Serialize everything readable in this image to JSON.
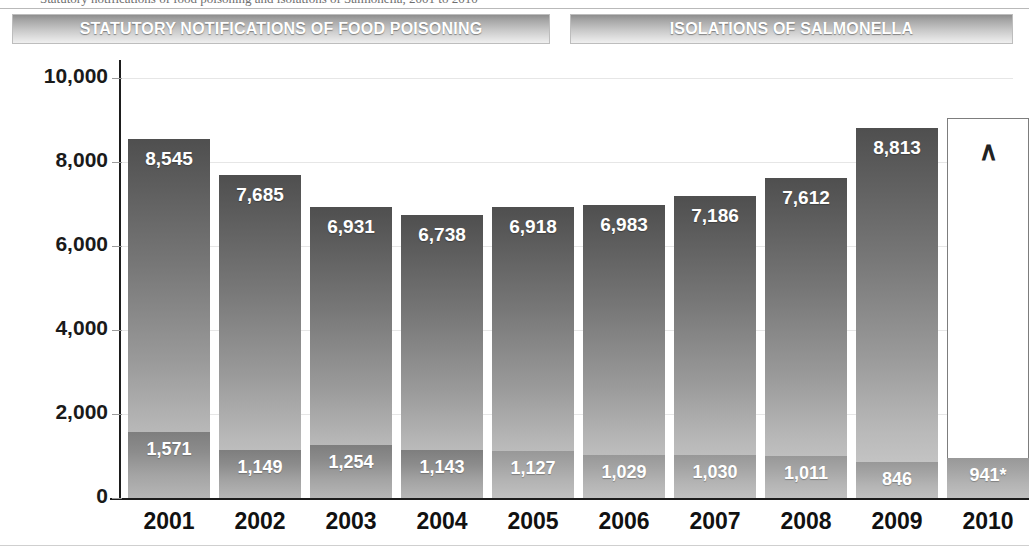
{
  "top_sliver": {
    "clipped_text": "Statutory notifications of food poisoning and isolations of Salmonella, 2001 to 2010"
  },
  "legend": {
    "left_label": "STATUTORY NOTIFICATIONS OF FOOD POISONING",
    "right_label": "ISOLATIONS OF SALMONELLA"
  },
  "chart_data": {
    "type": "bar",
    "title": "",
    "xlabel": "",
    "ylabel": "",
    "ylim": [
      0,
      10000
    ],
    "ytick_values": [
      0,
      2000,
      4000,
      6000,
      8000,
      10000
    ],
    "ytick_labels": [
      "0",
      "2,000",
      "4,000",
      "6,000",
      "8,000",
      "10,000"
    ],
    "grid": true,
    "legend_position": "top",
    "categories": [
      "2001",
      "2002",
      "2003",
      "2004",
      "2005",
      "2006",
      "2007",
      "2008",
      "2009",
      "2010"
    ],
    "series": [
      {
        "name": "STATUTORY NOTIFICATIONS OF FOOD POISONING",
        "values": [
          8545,
          7685,
          6931,
          6738,
          6918,
          6983,
          7186,
          7612,
          8813,
          null
        ],
        "labels": [
          "8,545",
          "7,685",
          "6,931",
          "6,738",
          "6,918",
          "6,983",
          "7,186",
          "7,612",
          "8,813",
          "∧"
        ],
        "color": "#6f6f6f"
      },
      {
        "name": "ISOLATIONS OF SALMONELLA",
        "values": [
          1571,
          1149,
          1254,
          1143,
          1127,
          1029,
          1030,
          1011,
          846,
          941
        ],
        "labels": [
          "1,571",
          "1,149",
          "1,254",
          "1,143",
          "1,127",
          "1,029",
          "1,030",
          "1,011",
          "846",
          "941*"
        ],
        "color": "#9a9a9a"
      }
    ],
    "annotations": [
      {
        "category": "2010",
        "symbol": "∧",
        "meaning": "value-not-available-marker"
      },
      {
        "category": "2010",
        "note": "941* provisional figure"
      }
    ]
  }
}
